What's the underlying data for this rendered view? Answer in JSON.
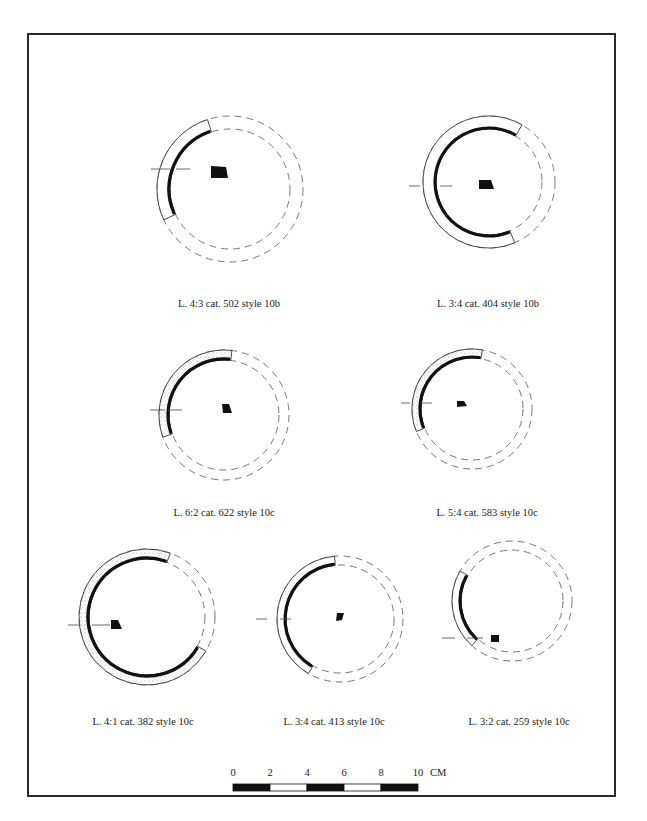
{
  "plate": {
    "frame_color": "#2a2a2a",
    "ink_color": "#111111",
    "dash_color": "#555555"
  },
  "figures": [
    {
      "id": "fig-1",
      "caption": "L. 4:3 cat. 502 style 10b",
      "caption_pos": [
        229,
        298
      ],
      "center": [
        230,
        189
      ],
      "r_outer": 73,
      "r_inner": 60,
      "arc_start_deg": 108,
      "arc_end_deg": 205,
      "hatched": false,
      "axis_y": 169,
      "axis_tick_left": [
        151,
        170
      ],
      "axis_tick_right": [
        176,
        190
      ],
      "section": [
        [
          211,
          166
        ],
        [
          226,
          167
        ],
        [
          228,
          178
        ],
        [
          211,
          178
        ]
      ]
    },
    {
      "id": "fig-2",
      "caption": "L. 3:4 cat. 404 style 10b",
      "caption_pos": [
        488,
        298
      ],
      "center": [
        489,
        182
      ],
      "r_outer": 66,
      "r_inner": 53,
      "arc_start_deg": 60,
      "arc_end_deg": 293,
      "hatched": false,
      "axis_y": 186,
      "axis_tick_left": [
        409,
        420
      ],
      "axis_tick_right": [
        440,
        452
      ],
      "section": [
        [
          479,
          180
        ],
        [
          491,
          180
        ],
        [
          494,
          189
        ],
        [
          479,
          189
        ]
      ]
    },
    {
      "id": "fig-3",
      "caption": "L. 6:2 cat. 622 style 10c",
      "caption_pos": [
        224,
        507
      ],
      "center": [
        224,
        415
      ],
      "r_outer": 65,
      "r_inner": 55,
      "arc_start_deg": 83,
      "arc_end_deg": 200,
      "hatched": true,
      "axis_y": 410,
      "axis_tick_left": [
        150,
        165
      ],
      "axis_tick_right": [
        168,
        182
      ],
      "section": [
        [
          222,
          404
        ],
        [
          229,
          404
        ],
        [
          232,
          413
        ],
        [
          223,
          413
        ]
      ]
    },
    {
      "id": "fig-4",
      "caption": "L. 5:4 cat. 583 style 10c",
      "caption_pos": [
        487,
        507
      ],
      "center": [
        472,
        409
      ],
      "r_outer": 60,
      "r_inner": 51,
      "arc_start_deg": 80,
      "arc_end_deg": 202,
      "hatched": true,
      "axis_y": 403,
      "axis_tick_left": [
        401,
        410
      ],
      "axis_tick_right": [
        420,
        432
      ],
      "section": [
        [
          457,
          401
        ],
        [
          464,
          401
        ],
        [
          467,
          406
        ],
        [
          457,
          407
        ]
      ]
    },
    {
      "id": "fig-5",
      "caption": "L. 4:1 cat. 382 style 10c",
      "caption_pos": [
        143,
        716
      ],
      "center": [
        147,
        617
      ],
      "r_outer": 68,
      "r_inner": 58,
      "arc_start_deg": 70,
      "arc_end_deg": 330,
      "hatched": true,
      "axis_y": 625,
      "axis_tick_left": [
        68,
        80
      ],
      "axis_tick_right": [
        92,
        110
      ],
      "section": [
        [
          111,
          620
        ],
        [
          118,
          620
        ],
        [
          122,
          629
        ],
        [
          111,
          629
        ]
      ]
    },
    {
      "id": "fig-6",
      "caption": "L. 3:4 cat. 413 style 10c",
      "caption_pos": [
        334,
        716
      ],
      "center": [
        340,
        619
      ],
      "r_outer": 63,
      "r_inner": 54,
      "arc_start_deg": 95,
      "arc_end_deg": 240,
      "hatched": false,
      "axis_y": 619,
      "axis_tick_left": [
        256,
        267
      ],
      "axis_tick_right": [
        280,
        291
      ],
      "section": [
        [
          337,
          613
        ],
        [
          344,
          613
        ],
        [
          342,
          620
        ],
        [
          336,
          621
        ]
      ]
    },
    {
      "id": "fig-7",
      "caption": "L. 3:2 cat. 259 style 10c",
      "caption_pos": [
        519,
        716
      ],
      "center": [
        512,
        601
      ],
      "r_outer": 60,
      "r_inner": 51,
      "arc_start_deg": 150,
      "arc_end_deg": 228,
      "hatched": false,
      "axis_y": 638,
      "axis_tick_left": [
        442,
        455
      ],
      "axis_tick_right": [
        467,
        483
      ],
      "section": [
        [
          491,
          635
        ],
        [
          499,
          635
        ],
        [
          499,
          642
        ],
        [
          491,
          642
        ]
      ]
    }
  ],
  "scale_bar": {
    "x": 233,
    "y": 784,
    "segment_width": 37,
    "height": 7,
    "labels": [
      "0",
      "2",
      "4",
      "6",
      "8",
      "10"
    ],
    "unit": "CM",
    "label_y": 767
  }
}
